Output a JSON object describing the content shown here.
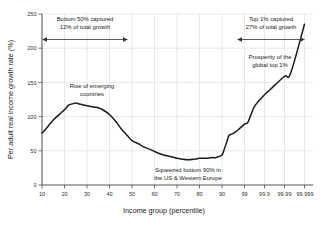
{
  "chart_data": {
    "type": "line",
    "title": "",
    "xlabel": "Income group (percentile)",
    "ylabel": "Per adult real income growth rate (%)",
    "xticklabels": [
      "10",
      "20",
      "30",
      "40",
      "50",
      "60",
      "70",
      "80",
      "90",
      "99",
      "99.9",
      "99.99",
      "99.999"
    ],
    "yticklabels": [
      "0",
      "50",
      "100",
      "150",
      "200",
      "250"
    ],
    "ylim": [
      0,
      250
    ],
    "grid": true,
    "legend": "none",
    "series": [
      {
        "name": "Per adult real income growth rate",
        "x": [
          10,
          12,
          15,
          18,
          20,
          22,
          24,
          25,
          27,
          30,
          33,
          35,
          37,
          40,
          43,
          45,
          48,
          50,
          53,
          55,
          58,
          60,
          63,
          65,
          68,
          70,
          72,
          75,
          78,
          80,
          83,
          85,
          87,
          88,
          90,
          92,
          94,
          95,
          96,
          97,
          98,
          99,
          99.3,
          99.5,
          99.7,
          99.9,
          99.95,
          99.99,
          99.995,
          99.999
        ],
        "values": [
          76,
          83,
          95,
          104,
          110,
          117,
          119,
          120,
          118,
          116,
          114,
          113,
          110,
          103,
          92,
          83,
          72,
          65,
          60,
          56,
          52,
          49,
          45,
          43,
          41,
          39,
          38,
          37,
          38,
          39,
          39,
          40,
          40,
          41,
          44,
          52,
          64,
          72,
          74,
          76,
          80,
          89,
          91,
          101,
          116,
          132,
          140,
          159,
          163,
          235
        ]
      }
    ],
    "annotations": [
      {
        "id": "bottom-50",
        "lines": [
          "Bottom 50% captured",
          "12% of total growth"
        ]
      },
      {
        "id": "top-1",
        "lines": [
          "Top 1% captured",
          "27% of total growth"
        ]
      },
      {
        "id": "emerging",
        "lines": [
          "Rise of emerging",
          "countries"
        ]
      },
      {
        "id": "squeezed",
        "lines": [
          "Squeezed bottom 90% in",
          "the US & Western Europe"
        ]
      },
      {
        "id": "prosperity",
        "lines": [
          "Prosperity of the",
          "global top 1%"
        ]
      }
    ],
    "colors": {
      "curve": "#1a1a1a",
      "grid": "#d9d9d9",
      "axis": "#555555",
      "background": "#ffffff",
      "text": "#1a1a1a"
    }
  }
}
